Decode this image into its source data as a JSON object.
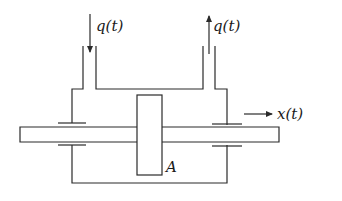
{
  "diagram": {
    "type": "hydraulic piston schematic",
    "labels": {
      "inflow": "q(t)",
      "outflow": "q(t)",
      "displacement": "x(t)",
      "piston": "A"
    },
    "colors": {
      "stroke": "#2a2a2a",
      "background": "#ffffff"
    }
  }
}
